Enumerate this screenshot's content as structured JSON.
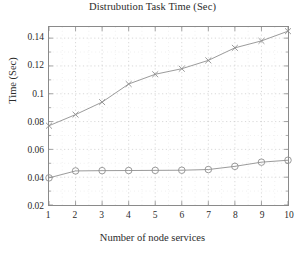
{
  "chart_data": {
    "type": "line",
    "title": "Distrubution Task Time (Sec)",
    "xlabel": "Number of node services",
    "ylabel": "Time (Sec)",
    "x": [
      1,
      2,
      3,
      4,
      5,
      6,
      7,
      8,
      9,
      10
    ],
    "xlim": [
      1,
      10
    ],
    "ylim": [
      0.02,
      0.148
    ],
    "xticks": [
      "1",
      "2",
      "3",
      "4",
      "5",
      "6",
      "7",
      "8",
      "9",
      "10"
    ],
    "yticks": [
      "0.02",
      "0.04",
      "0.06",
      "0.08",
      "0.1",
      "0.12",
      "0.14"
    ],
    "ytick_values": [
      0.02,
      0.04,
      0.06,
      0.08,
      0.1,
      0.12,
      0.14
    ],
    "grid": true,
    "minor_grid": true,
    "legend": "none",
    "series": [
      {
        "name": "upper-series",
        "marker": "cross",
        "color": "#8f8f8f",
        "values": [
          0.077,
          0.085,
          0.094,
          0.107,
          0.114,
          0.118,
          0.124,
          0.133,
          0.138,
          0.145
        ]
      },
      {
        "name": "lower-series",
        "marker": "circle",
        "color": "#8f8f8f",
        "values": [
          0.0395,
          0.0445,
          0.0447,
          0.0448,
          0.0449,
          0.045,
          0.0455,
          0.0478,
          0.0508,
          0.0522
        ]
      }
    ]
  },
  "colors": {
    "axis": "#8a8a8a",
    "grid": "#c8c8c8",
    "minor_grid": "#dcdcdc",
    "text": "#2b2b2b",
    "line": "#8f8f8f"
  }
}
